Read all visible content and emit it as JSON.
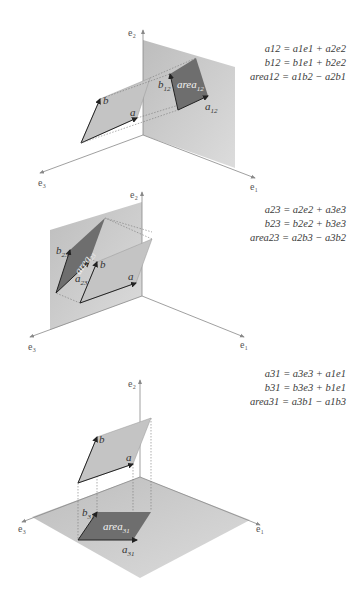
{
  "panels": [
    {
      "id": "e1e2",
      "axes": {
        "up": "e2",
        "right": "e1",
        "left": "e3"
      },
      "labels": {
        "a": "a",
        "b": "b",
        "proj_a": "a12",
        "proj_b": "b12",
        "area": "area12"
      },
      "formulas": [
        "a12 = a1e1 + a2e2",
        "b12 = b1e1 + b2e2",
        "area12 = a1b2 − a2b1"
      ]
    },
    {
      "id": "e2e3",
      "axes": {
        "up": "e2",
        "right": "e1",
        "left": "e3"
      },
      "labels": {
        "a": "a",
        "b": "b",
        "proj_a": "a23",
        "proj_b": "b23",
        "area": "area23"
      },
      "formulas": [
        "a23 = a2e2 + a3e3",
        "b23 = b2e2 + b3e3",
        "area23 = a2b3 − a3b2"
      ]
    },
    {
      "id": "e3e1",
      "axes": {
        "up": "e2",
        "right": "e1",
        "left": "e3"
      },
      "labels": {
        "a": "a",
        "b": "b",
        "proj_a": "a31",
        "proj_b": "b31",
        "area": "area31"
      },
      "formulas": [
        "a31 = a3e3 + a1e1",
        "b31 = b3e3 + b1e1",
        "area31 = a3b1 − a1b3"
      ]
    }
  ],
  "colors": {
    "plane": "#c9c9c9",
    "parallelogram": "#b9b9b9",
    "projection": "#6e6e6e",
    "axis": "#8a8a8a",
    "vector": "#222222"
  }
}
